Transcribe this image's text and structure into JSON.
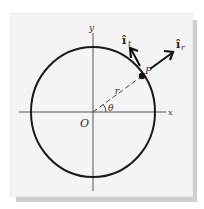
{
  "diagram": {
    "type": "polar-coordinates-unit-vectors",
    "labels": {
      "y_axis": "y",
      "x_axis": "x",
      "origin": "O",
      "point": "P",
      "radius": "r",
      "angle": "θ",
      "unit_radial": "î",
      "unit_radial_sub": "r",
      "unit_tangential": "î",
      "unit_tangential_sub": "t"
    },
    "colors": {
      "ink": "#1a1a1a",
      "axis": "#555555",
      "panel": "#f4f4f4",
      "shadow": "#cfcfcf"
    }
  }
}
